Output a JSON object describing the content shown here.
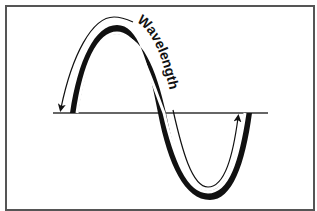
{
  "diagram": {
    "label": "Wavelength",
    "colors": {
      "wave": "#111111",
      "axis": "#333333",
      "arrow": "#111111",
      "frame": "#555555",
      "background": "#ffffff"
    },
    "elements": {
      "axis_line": "horizontal baseline",
      "wave": "sine wave with thick shaded outer edge",
      "arrow": "curved arrow tracing one full wavelength from left start to right end"
    }
  }
}
